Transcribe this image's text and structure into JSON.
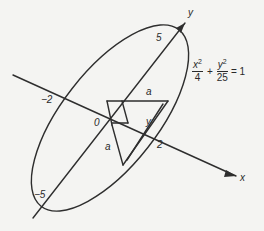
{
  "diagram": {
    "equation": {
      "term1": {
        "numerator_var": "x",
        "exponent": "2",
        "denominator": "4"
      },
      "plus": "+",
      "term2": {
        "numerator_var": "y",
        "exponent": "2",
        "denominator": "25"
      },
      "equals": "= 1"
    },
    "axes": {
      "x_label": "x",
      "y_label": "y"
    },
    "tick_labels": {
      "y_pos": "5",
      "y_neg": "−5",
      "x_pos": "2",
      "x_neg": "−2",
      "origin": "0"
    },
    "segment_labels": {
      "upper_a": "a",
      "lower_a": "a",
      "y": "y"
    },
    "colors": {
      "stroke": "#2e2e2e",
      "background": "#f4f4f2"
    }
  }
}
